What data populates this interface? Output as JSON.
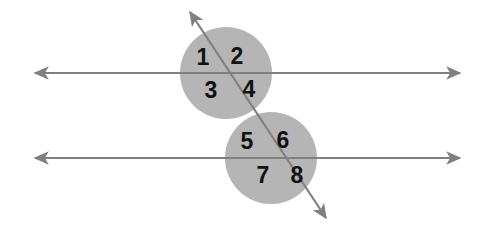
{
  "figure": {
    "width": 493,
    "height": 242,
    "background_color": "#ffffff"
  },
  "colors": {
    "line": "#808080",
    "circle_fill": "#b5b5b5",
    "label_text": "#111111",
    "background": "#ffffff"
  },
  "lines": [
    {
      "id": "upper-parallel-line",
      "kind": "horizontal-parallel",
      "x1": 35,
      "y1": 73,
      "x2": 460,
      "y2": 73,
      "arrow_start": true,
      "arrow_end": true
    },
    {
      "id": "lower-parallel-line",
      "kind": "horizontal-parallel",
      "x1": 35,
      "y1": 158,
      "x2": 460,
      "y2": 158,
      "arrow_start": true,
      "arrow_end": true
    },
    {
      "id": "transversal-line",
      "kind": "transversal",
      "x1": 190,
      "y1": 12,
      "x2": 326,
      "y2": 218,
      "arrow_start": true,
      "arrow_end": true
    }
  ],
  "intersections": [
    {
      "id": "upper-intersection",
      "cx": 226,
      "cy": 73,
      "r": 46
    },
    {
      "id": "lower-intersection",
      "cx": 271,
      "cy": 158,
      "r": 46
    }
  ],
  "angle_labels": [
    {
      "text": "1",
      "x": 203,
      "y": 58,
      "group": "upper",
      "quadrant": "top-left"
    },
    {
      "text": "2",
      "x": 237,
      "y": 57,
      "group": "upper",
      "quadrant": "top-right"
    },
    {
      "text": "3",
      "x": 211,
      "y": 91,
      "group": "upper",
      "quadrant": "bottom-left"
    },
    {
      "text": "4",
      "x": 249,
      "y": 90,
      "group": "upper",
      "quadrant": "bottom-right"
    },
    {
      "text": "5",
      "x": 247,
      "y": 142,
      "group": "lower",
      "quadrant": "top-left"
    },
    {
      "text": "6",
      "x": 283,
      "y": 141,
      "group": "lower",
      "quadrant": "top-right"
    },
    {
      "text": "7",
      "x": 263,
      "y": 176,
      "group": "lower",
      "quadrant": "bottom-left"
    },
    {
      "text": "8",
      "x": 297,
      "y": 176,
      "group": "lower",
      "quadrant": "bottom-right"
    }
  ]
}
